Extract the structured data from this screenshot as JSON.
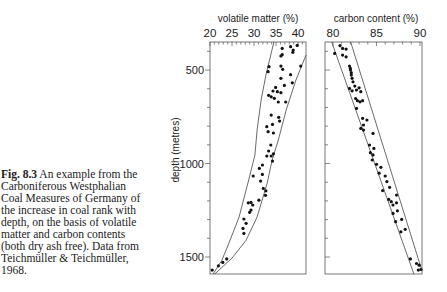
{
  "figure_caption": {
    "label": "Fig. 8.3",
    "lines": [
      "An example from the",
      "Carboniferous Westphalian",
      "Coal Measures of Germany of",
      "the increase in coal rank with",
      "depth, on the basis of volatile",
      "matter and carbon contents",
      "(both dry ash free). Data from",
      "Teichmüller & Teichmüller,",
      "1968."
    ]
  },
  "chart_data": [
    {
      "type": "scatter",
      "title": "",
      "xlabel": "volatile matter (%)",
      "ylabel": "depth (metres)",
      "x_axis_position": "top",
      "x_ticks": [
        20,
        25,
        30,
        35,
        40
      ],
      "x_minor_step": 1,
      "xlim": [
        20,
        41.8
      ],
      "y_ticks": [
        500,
        1000,
        1500
      ],
      "y_minor_step": 100,
      "ylim": [
        350,
        1591
      ],
      "y_inverted": true,
      "show_y_tick_labels": true,
      "grid": false,
      "legend": null,
      "series": [
        {
          "name": "samples",
          "points": [
            [
              36.4,
              384
            ],
            [
              38.3,
              375
            ],
            [
              39.8,
              368
            ],
            [
              38.9,
              393
            ],
            [
              38.8,
              405
            ],
            [
              36.4,
              418
            ],
            [
              36.1,
              425
            ],
            [
              33.4,
              482
            ],
            [
              33.2,
              509
            ],
            [
              36.1,
              479
            ],
            [
              36.5,
              496
            ],
            [
              40.6,
              479
            ],
            [
              38.3,
              525
            ],
            [
              36.1,
              544
            ],
            [
              38.7,
              568
            ],
            [
              36.9,
              582
            ],
            [
              34.9,
              593
            ],
            [
              34.3,
              612
            ],
            [
              35.3,
              616
            ],
            [
              36.1,
              621
            ],
            [
              33.3,
              635
            ],
            [
              33.9,
              643
            ],
            [
              34.6,
              651
            ],
            [
              35.5,
              671
            ],
            [
              37.2,
              671
            ],
            [
              33.9,
              741
            ],
            [
              35.6,
              753
            ],
            [
              35.8,
              773
            ],
            [
              32.9,
              803
            ],
            [
              34.2,
              791
            ],
            [
              33.2,
              830
            ],
            [
              34.4,
              837
            ],
            [
              33.8,
              901
            ],
            [
              33.3,
              933
            ],
            [
              34.4,
              948
            ],
            [
              32.9,
              960
            ],
            [
              33.9,
              960
            ],
            [
              34.2,
              987
            ],
            [
              31.9,
              1008
            ],
            [
              31.2,
              1026
            ],
            [
              31.9,
              1058
            ],
            [
              29.8,
              1067
            ],
            [
              31.5,
              1094
            ],
            [
              32.1,
              1133
            ],
            [
              32.7,
              1146
            ],
            [
              32.6,
              1170
            ],
            [
              31.1,
              1196
            ],
            [
              28.7,
              1210
            ],
            [
              29.3,
              1208
            ],
            [
              29.7,
              1222
            ],
            [
              29.3,
              1249
            ],
            [
              29.0,
              1261
            ],
            [
              27.7,
              1297
            ],
            [
              28.2,
              1320
            ],
            [
              27.5,
              1347
            ],
            [
              27.7,
              1374
            ],
            [
              23.8,
              1510
            ],
            [
              22.9,
              1529
            ],
            [
              21.9,
              1547
            ],
            [
              20.5,
              1570
            ]
          ]
        }
      ],
      "envelope": {
        "left": [
          [
            34.5,
            350
          ],
          [
            32.7,
            527
          ],
          [
            31.6,
            661
          ],
          [
            30.7,
            821
          ],
          [
            30.2,
            955
          ],
          [
            28.6,
            1105
          ],
          [
            26.6,
            1286
          ],
          [
            24.3,
            1426
          ],
          [
            22.7,
            1517
          ],
          [
            20.7,
            1591
          ]
        ],
        "right": [
          [
            41.8,
            420
          ],
          [
            39.5,
            554
          ],
          [
            37.3,
            714
          ],
          [
            35.5,
            875
          ],
          [
            34.1,
            982
          ],
          [
            33.0,
            1105
          ],
          [
            30.7,
            1286
          ],
          [
            28.2,
            1410
          ],
          [
            25.0,
            1506
          ],
          [
            21.1,
            1591
          ]
        ]
      }
    },
    {
      "type": "scatter",
      "title": "",
      "xlabel": "carbon content (%)",
      "ylabel": "depth (metres)",
      "x_axis_position": "top",
      "x_ticks": [
        80,
        85,
        90
      ],
      "x_minor_step": 1,
      "xlim": [
        79.08,
        90.23
      ],
      "y_ticks": [
        500,
        1000,
        1500
      ],
      "y_minor_step": 100,
      "ylim": [
        350,
        1591
      ],
      "y_inverted": true,
      "show_y_tick_labels": false,
      "grid": false,
      "legend": null,
      "series": [
        {
          "name": "samples",
          "points": [
            [
              80.8,
              370
            ],
            [
              81.1,
              384
            ],
            [
              81.5,
              388
            ],
            [
              80.2,
              411
            ],
            [
              81.1,
              420
            ],
            [
              81.5,
              429
            ],
            [
              81.9,
              479
            ],
            [
              82.0,
              491
            ],
            [
              82.0,
              500
            ],
            [
              82.1,
              514
            ],
            [
              82.1,
              527
            ],
            [
              82.2,
              544
            ],
            [
              82.3,
              563
            ],
            [
              82.5,
              586
            ],
            [
              81.9,
              598
            ],
            [
              82.2,
              611
            ],
            [
              82.7,
              607
            ],
            [
              83.0,
              595
            ],
            [
              83.2,
              616
            ],
            [
              82.6,
              652
            ],
            [
              82.8,
              664
            ],
            [
              83.1,
              670
            ],
            [
              83.4,
              664
            ],
            [
              82.7,
              705
            ],
            [
              83.4,
              758
            ],
            [
              83.9,
              767
            ],
            [
              83.5,
              794
            ],
            [
              83.2,
              812
            ],
            [
              83.5,
              821
            ],
            [
              84.6,
              839
            ],
            [
              84.2,
              901
            ],
            [
              84.7,
              919
            ],
            [
              84.3,
              942
            ],
            [
              84.6,
              954
            ],
            [
              84.5,
              981
            ],
            [
              85.0,
              1004
            ],
            [
              85.5,
              1020
            ],
            [
              85.3,
              1052
            ],
            [
              86.0,
              1067
            ],
            [
              86.2,
              1097
            ],
            [
              86.5,
              1127
            ],
            [
              85.7,
              1145
            ],
            [
              87.3,
              1169
            ],
            [
              86.4,
              1192
            ],
            [
              86.7,
              1204
            ],
            [
              87.3,
              1210
            ],
            [
              86.9,
              1222
            ],
            [
              87.4,
              1253
            ],
            [
              86.9,
              1267
            ],
            [
              87.9,
              1299
            ],
            [
              87.2,
              1311
            ],
            [
              88.3,
              1352
            ],
            [
              87.8,
              1365
            ],
            [
              88.9,
              1510
            ],
            [
              89.6,
              1535
            ],
            [
              89.9,
              1544
            ],
            [
              90.1,
              1567
            ],
            [
              89.8,
              1570
            ]
          ]
        }
      ],
      "envelope": {
        "left": [
          [
            79.85,
            350
          ],
          [
            89.3,
            1591
          ]
        ],
        "right": [
          [
            82.03,
            350
          ],
          [
            90.23,
            1574
          ]
        ]
      }
    }
  ]
}
